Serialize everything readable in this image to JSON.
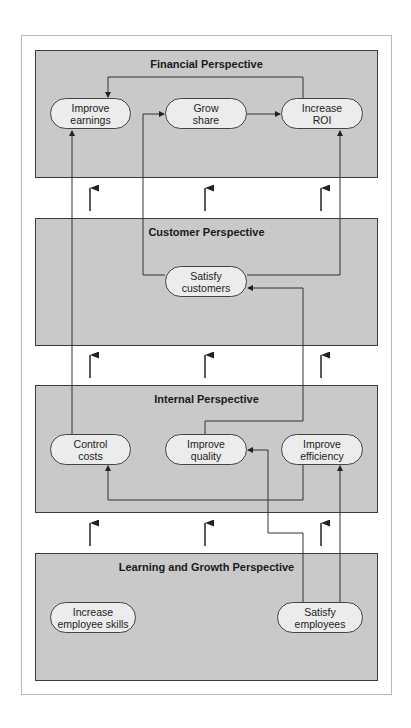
{
  "panels": [
    {
      "title": "Financial Perspective",
      "nodes": [
        {
          "label": "Improve\nearnings"
        },
        {
          "label": "Grow\nshare"
        },
        {
          "label": "Increase\nROI"
        }
      ]
    },
    {
      "title": "Customer Perspective",
      "nodes": [
        {
          "label": "Satisfy\ncustomers"
        }
      ]
    },
    {
      "title": "Internal Perspective",
      "nodes": [
        {
          "label": "Control\ncosts"
        },
        {
          "label": "Improve\nquality"
        },
        {
          "label": "Improve\nefficiency"
        }
      ]
    },
    {
      "title": "Learning and Growth Perspective",
      "nodes": [
        {
          "label": "Increase\nemployee skills"
        },
        {
          "label": "Satisfy\nemployees"
        }
      ]
    }
  ],
  "colors": {
    "panel_fill": "#c9c9c9",
    "panel_border": "#3c3c3c",
    "node_fill": "#ececec",
    "line": "#333333"
  }
}
